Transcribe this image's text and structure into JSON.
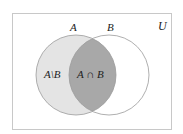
{
  "diagram": {
    "type": "venn",
    "universe": {
      "label": "U",
      "rect": {
        "x": 12.5,
        "y": 13.5,
        "width": 159,
        "height": 116
      },
      "stroke": "#c8c8c8"
    },
    "sets": [
      {
        "name": "A",
        "label": "A",
        "cx": 76,
        "cy": 75,
        "r": 40
      },
      {
        "name": "B",
        "label": "B",
        "cx": 109,
        "cy": 75,
        "r": 40
      }
    ],
    "regions": {
      "a_minus_b": {
        "label": "A\\B",
        "fill": "#e4e4e4"
      },
      "a_intersect_b": {
        "label": "A ∩ B",
        "fill": "#a8a8a8"
      }
    },
    "circle_stroke": "#9a9a9a"
  }
}
